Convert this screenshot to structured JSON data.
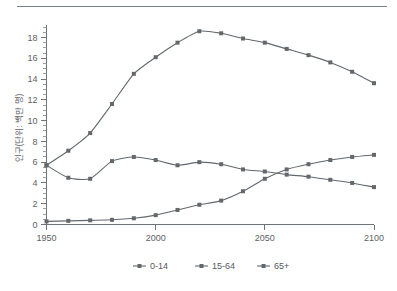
{
  "chart_data": {
    "type": "line",
    "title": "",
    "subtitle": "",
    "xlabel": "",
    "ylabel": "인구(단위: 백만 명)",
    "xlim": [
      1950,
      2100
    ],
    "ylim": [
      0,
      19.2
    ],
    "x_ticks": [
      1950,
      2000,
      2050,
      2100
    ],
    "y_ticks": [
      0,
      2,
      4,
      6,
      8,
      10,
      12,
      14,
      16,
      18
    ],
    "y_minor_step": 0.5,
    "grid": false,
    "legend_position": "bottom",
    "marker": "square",
    "series": [
      {
        "name": "0-14",
        "color": "#63686d",
        "x": [
          1950,
          1960,
          1970,
          1980,
          1990,
          2000,
          2010,
          2020,
          2030,
          2040,
          2050,
          2060,
          2070,
          2080,
          2090,
          2100
        ],
        "values": [
          5.7,
          4.5,
          4.4,
          6.1,
          6.5,
          6.2,
          5.7,
          6.0,
          5.8,
          5.3,
          5.1,
          4.8,
          4.6,
          4.3,
          4.0,
          3.6
        ]
      },
      {
        "name": "15-64",
        "color": "#63686d",
        "x": [
          1950,
          1960,
          1970,
          1980,
          1990,
          2000,
          2010,
          2020,
          2030,
          2040,
          2050,
          2060,
          2070,
          2080,
          2090,
          2100
        ],
        "values": [
          5.7,
          7.1,
          8.8,
          11.6,
          14.5,
          16.1,
          17.5,
          18.6,
          18.4,
          17.9,
          17.5,
          16.9,
          16.3,
          15.6,
          14.7,
          13.6
        ]
      },
      {
        "name": "65+",
        "color": "#63686d",
        "x": [
          1950,
          1960,
          1970,
          1980,
          1990,
          2000,
          2010,
          2020,
          2030,
          2040,
          2050,
          2060,
          2070,
          2080,
          2090,
          2100
        ],
        "values": [
          0.3,
          0.35,
          0.4,
          0.45,
          0.6,
          0.9,
          1.4,
          1.9,
          2.3,
          3.2,
          4.4,
          5.3,
          5.8,
          6.2,
          6.5,
          6.7
        ]
      }
    ]
  },
  "legend": {
    "items": [
      {
        "label": "0-14"
      },
      {
        "label": "15-64"
      },
      {
        "label": "65+"
      }
    ]
  },
  "axes": {
    "y_axis_label": "인구(단위: 백만 명)",
    "x_tick_labels": [
      "1950",
      "2000",
      "2050",
      "2100"
    ],
    "y_tick_labels": [
      "0",
      "2",
      "4",
      "6",
      "8",
      "10",
      "12",
      "14",
      "16",
      "18"
    ]
  }
}
